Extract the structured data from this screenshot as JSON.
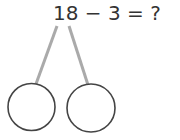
{
  "equation": {
    "text": "18 − 3 = ?",
    "minuend": "18",
    "operator": "−",
    "subtrahend": "3",
    "equals": "=",
    "answer": "?"
  },
  "number_bond": {
    "branch_color": "#aaaaaa",
    "circle_stroke": "#444444",
    "parts": [
      {
        "label": "left-part",
        "value": ""
      },
      {
        "label": "right-part",
        "value": ""
      }
    ]
  }
}
